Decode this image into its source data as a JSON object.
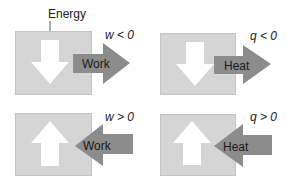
{
  "diagram": {
    "energy_label": "Energy",
    "panels": [
      {
        "id": "work-out",
        "condition": "w < 0",
        "arrow_label": "Work",
        "internal_arrow": "down",
        "external_arrow": "outward-right"
      },
      {
        "id": "heat-out",
        "condition": "q < 0",
        "arrow_label": "Heat",
        "internal_arrow": "down",
        "external_arrow": "outward-right"
      },
      {
        "id": "work-in",
        "condition": "w > 0",
        "arrow_label": "Work",
        "internal_arrow": "up",
        "external_arrow": "inward-left"
      },
      {
        "id": "heat-in",
        "condition": "q > 0",
        "arrow_label": "Heat",
        "internal_arrow": "up",
        "external_arrow": "inward-left"
      }
    ],
    "colors": {
      "box": "#d5d5d5",
      "arrow_external": "#8c8c8c",
      "arrow_internal": "#ffffff"
    }
  }
}
